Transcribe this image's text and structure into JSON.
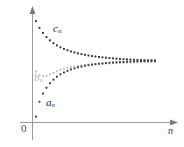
{
  "figure": {
    "background_color": "#ffffff",
    "axis_color": "#9a9a9a",
    "origin_label": "0",
    "x_axis_label": "n",
    "y_axis_label": ""
  },
  "labels": {
    "series_c": "c",
    "series_c_sub": "n",
    "series_b": "b",
    "series_b_sub": "n",
    "series_a": "a",
    "series_a_sub": "n"
  },
  "colors": {
    "series_a": "#3b3b3b",
    "series_b": "#bdbdbd",
    "series_c": "#2e2e2e",
    "axis": "#9a9a9a",
    "label_b": "#b4b4b4",
    "text": "#2b2b2b"
  },
  "chart_data": {
    "type": "scatter",
    "title": "",
    "subtitle": "",
    "xlabel": "n",
    "ylabel": "",
    "grid": false,
    "legend_position": "inline-annotations",
    "annotations": [
      {
        "text": "c_n",
        "x": 6.2,
        "y": 0.86,
        "color": "#2e2e2e"
      },
      {
        "text": "b_n",
        "x": 1.3,
        "y": 0.455,
        "color": "#b4b4b4"
      },
      {
        "text": "a_n",
        "x": 4.0,
        "y": 0.245,
        "color": "#2b2b2b"
      }
    ],
    "xlim": [
      0,
      40
    ],
    "ylim": [
      0,
      1
    ],
    "x": [
      1,
      2,
      3,
      4,
      5,
      6,
      7,
      8,
      9,
      10,
      11,
      12,
      13,
      14,
      15,
      16,
      17,
      18,
      19,
      20,
      21,
      22,
      23,
      24,
      25,
      26,
      27,
      28,
      29,
      30,
      31,
      32,
      33,
      34,
      35
    ],
    "series": [
      {
        "name": "c_n",
        "color": "#2e2e2e",
        "marker": "dot",
        "values": [
          0.905,
          0.845,
          0.8,
          0.762,
          0.733,
          0.708,
          0.688,
          0.671,
          0.657,
          0.645,
          0.634,
          0.625,
          0.617,
          0.61,
          0.604,
          0.598,
          0.593,
          0.589,
          0.585,
          0.581,
          0.578,
          0.575,
          0.572,
          0.57,
          0.567,
          0.565,
          0.563,
          0.562,
          0.56,
          0.559,
          0.557,
          0.556,
          0.555,
          0.554,
          0.553
        ]
      },
      {
        "name": "b_n",
        "color": "#bdbdbd",
        "marker": "dot",
        "values": [
          0.455,
          0.423,
          0.412,
          0.416,
          0.428,
          0.443,
          0.457,
          0.469,
          0.479,
          0.487,
          0.494,
          0.5,
          0.505,
          0.509,
          0.513,
          0.516,
          0.519,
          0.521,
          0.523,
          0.525,
          0.527,
          0.528,
          0.53,
          0.531,
          0.532,
          0.533,
          0.534,
          0.535,
          0.536,
          0.536,
          0.537,
          0.538,
          0.538,
          0.539,
          0.539
        ]
      },
      {
        "name": "a_n",
        "color": "#3b3b3b",
        "marker": "dot",
        "values": [
          0.052,
          0.185,
          0.258,
          0.31,
          0.35,
          0.382,
          0.408,
          0.429,
          0.446,
          0.461,
          0.473,
          0.483,
          0.492,
          0.499,
          0.506,
          0.511,
          0.516,
          0.52,
          0.524,
          0.527,
          0.53,
          0.533,
          0.535,
          0.537,
          0.539,
          0.54,
          0.542,
          0.543,
          0.545,
          0.546,
          0.547,
          0.548,
          0.549,
          0.55,
          0.55
        ]
      }
    ]
  }
}
